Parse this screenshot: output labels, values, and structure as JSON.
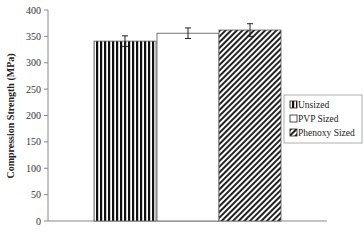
{
  "chart_data": {
    "type": "bar",
    "title": "",
    "xlabel": "",
    "ylabel": "Compression Strength (MPa)",
    "ylim": [
      0,
      400
    ],
    "yticks": [
      0,
      50,
      100,
      150,
      200,
      250,
      300,
      350,
      400
    ],
    "grid": false,
    "legend_position": "right",
    "categories": [
      "Unsized",
      "PVP Sized",
      "Phenoxy Sized"
    ],
    "values": [
      341,
      356,
      362
    ],
    "errors": [
      10,
      10,
      12
    ],
    "series": [
      {
        "name": "Unsized",
        "value": 341,
        "error": 10,
        "pattern": "vertical-stripes"
      },
      {
        "name": "PVP Sized",
        "value": 356,
        "error": 10,
        "pattern": "white"
      },
      {
        "name": "Phenoxy Sized",
        "value": 362,
        "error": 12,
        "pattern": "diagonal-hatch"
      }
    ]
  },
  "legend": {
    "items": [
      "Unsized",
      "PVP Sized",
      "Phenoxy Sized"
    ]
  },
  "colors": {
    "stroke": "#222222",
    "axis": "#888888",
    "background": "#ffffff"
  }
}
